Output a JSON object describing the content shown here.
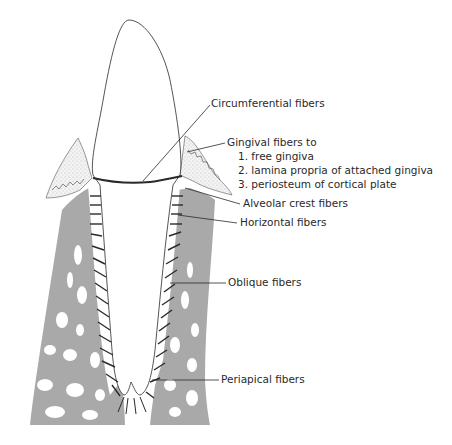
{
  "diagram": {
    "colors": {
      "bone": "#a9a9a9",
      "ink": "#2a2a2a",
      "gingiva_stipple": "#d8d8d8",
      "background": "#ffffff"
    },
    "labels": {
      "circumferential": "Circumferential fibers",
      "gingival": {
        "title": "Gingival fibers to",
        "items": [
          "1.  free gingiva",
          "2.  lamina propria of attached gingiva",
          "3.  periosteum of cortical plate"
        ]
      },
      "alveolar_crest": "Alveolar crest fibers",
      "horizontal": "Horizontal fibers",
      "oblique": "Oblique fibers",
      "periapical": "Periapical fibers"
    }
  }
}
